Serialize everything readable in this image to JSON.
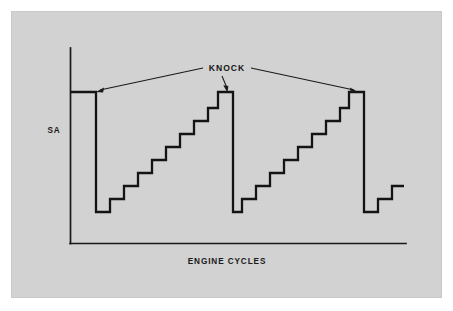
{
  "figure": {
    "background_color": "#ffffff",
    "panel_color": "#d2d2d2",
    "line_color": "#141414",
    "axis_color": "#1a1a1a",
    "y_axis_label": "SA",
    "x_axis_label": "ENGINE CYCLES",
    "callout_label": "KNOCK"
  },
  "chart_data": {
    "type": "line",
    "title": "",
    "subtitle": "",
    "xlabel": "ENGINE CYCLES",
    "ylabel": "SA",
    "grid": false,
    "legend": "none",
    "axis_ticks": {
      "x": [],
      "y": []
    },
    "annotations": [
      {
        "text": "KNOCK",
        "x": 227,
        "y": 70,
        "points_to": [
          {
            "x": 96,
            "y": 92
          },
          {
            "x": 227,
            "y": 92
          },
          {
            "x": 358,
            "y": 92
          }
        ]
      }
    ],
    "series": [
      {
        "name": "Spark Advance",
        "units": "degrees (relative)",
        "step_count_per_ramp": 9,
        "knock_events": 3,
        "points": [
          {
            "x": 70,
            "y": 92
          },
          {
            "x": 96,
            "y": 92
          },
          {
            "x": 96,
            "y": 212
          },
          {
            "x": 110,
            "y": 212
          },
          {
            "x": 110,
            "y": 199
          },
          {
            "x": 124,
            "y": 199
          },
          {
            "x": 124,
            "y": 186
          },
          {
            "x": 138,
            "y": 186
          },
          {
            "x": 138,
            "y": 173
          },
          {
            "x": 152,
            "y": 173
          },
          {
            "x": 152,
            "y": 160
          },
          {
            "x": 166,
            "y": 160
          },
          {
            "x": 166,
            "y": 147
          },
          {
            "x": 180,
            "y": 147
          },
          {
            "x": 180,
            "y": 134
          },
          {
            "x": 194,
            "y": 134
          },
          {
            "x": 194,
            "y": 121
          },
          {
            "x": 208,
            "y": 121
          },
          {
            "x": 208,
            "y": 108
          },
          {
            "x": 218,
            "y": 108
          },
          {
            "x": 218,
            "y": 92
          },
          {
            "x": 233,
            "y": 92
          },
          {
            "x": 233,
            "y": 212
          },
          {
            "x": 242,
            "y": 212
          },
          {
            "x": 242,
            "y": 199
          },
          {
            "x": 256,
            "y": 199
          },
          {
            "x": 256,
            "y": 186
          },
          {
            "x": 270,
            "y": 186
          },
          {
            "x": 270,
            "y": 173
          },
          {
            "x": 284,
            "y": 173
          },
          {
            "x": 284,
            "y": 160
          },
          {
            "x": 298,
            "y": 160
          },
          {
            "x": 298,
            "y": 147
          },
          {
            "x": 312,
            "y": 147
          },
          {
            "x": 312,
            "y": 134
          },
          {
            "x": 326,
            "y": 134
          },
          {
            "x": 326,
            "y": 121
          },
          {
            "x": 340,
            "y": 121
          },
          {
            "x": 340,
            "y": 108
          },
          {
            "x": 349,
            "y": 108
          },
          {
            "x": 349,
            "y": 92
          },
          {
            "x": 364,
            "y": 92
          },
          {
            "x": 364,
            "y": 212
          },
          {
            "x": 378,
            "y": 212
          },
          {
            "x": 378,
            "y": 199
          },
          {
            "x": 392,
            "y": 199
          },
          {
            "x": 392,
            "y": 186
          },
          {
            "x": 404,
            "y": 186
          }
        ]
      }
    ],
    "axis_geometry": {
      "y_axis": {
        "x": 70,
        "y_top": 48,
        "y_bottom": 243
      },
      "x_axis": {
        "y": 243,
        "x_left": 70,
        "x_right": 406
      }
    }
  }
}
